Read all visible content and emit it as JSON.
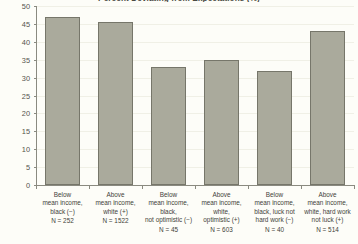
{
  "chart_data": {
    "type": "bar",
    "title": "Percent Deviating from Expectations (%)",
    "xlabel": "",
    "ylabel": "",
    "ylim": [
      0,
      50
    ],
    "yticks": [
      0,
      5,
      10,
      15,
      20,
      25,
      30,
      35,
      40,
      45,
      50
    ],
    "grid": true,
    "legend": false,
    "bar_color": "#aaaa9c",
    "bar_border_color": "#76766a",
    "background_color": "#fdfdf8",
    "categories": [
      "Below mean income, black (−) N = 252",
      "Above mean income, white (+) N = 1522",
      "Below mean income, black, not optimistic (−) N = 45",
      "Above mean income, white, optimistic (+) N = 603",
      "Below mean income, black, luck not hard work (−) N = 40",
      "Above mean income, white, hard work not luck (+) N = 514"
    ],
    "values": [
      47,
      45.5,
      33,
      35,
      31.8,
      43
    ]
  },
  "chart": {
    "title": "Percent Deviating from Expectations (%)",
    "y_ticks": [
      "50",
      "45",
      "40",
      "35",
      "30",
      "25",
      "20",
      "15",
      "10",
      "5",
      "0"
    ],
    "bars": [
      {
        "value": 47,
        "lines": [
          "Below",
          "mean income,",
          "black (−)"
        ],
        "n_label": "N = 252"
      },
      {
        "value": 45.5,
        "lines": [
          "Above",
          "mean income,",
          "white (+)"
        ],
        "n_label": "N = 1522"
      },
      {
        "value": 33,
        "lines": [
          "Below",
          "mean income,",
          "black,",
          "not optimistic (−)"
        ],
        "n_label": "N = 45"
      },
      {
        "value": 35,
        "lines": [
          "Above",
          "mean income,",
          "white,",
          "optimistic (+)"
        ],
        "n_label": "N = 603"
      },
      {
        "value": 31.8,
        "lines": [
          "Below",
          "mean income,",
          "black, luck not",
          "hard work (−)"
        ],
        "n_label": "N = 40"
      },
      {
        "value": 43,
        "lines": [
          "Above",
          "mean income,",
          "white, hard work",
          "not luck (+)"
        ],
        "n_label": "N = 514"
      }
    ]
  }
}
